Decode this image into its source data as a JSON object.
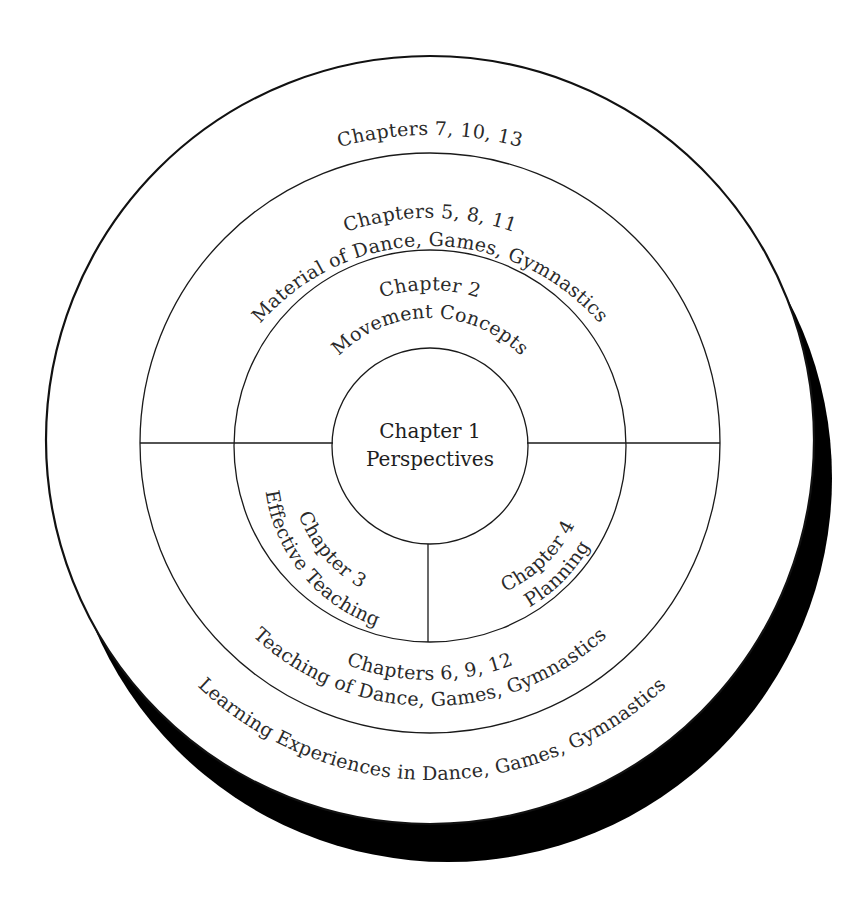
{
  "diagram": {
    "title": "",
    "colors": {
      "line": "#1a1a1a",
      "shadow": "#000000",
      "background": "#ffffff",
      "text": "#2a2a2a"
    },
    "center": {
      "line1": "Chapter 1",
      "line2": "Perspectives"
    },
    "ring2": {
      "top": {
        "line1": "Chapter 2",
        "line2": "Movement Concepts"
      },
      "bottom_left": {
        "line1": "Chapter 3",
        "line2": "Effective Teaching"
      },
      "bottom_right": {
        "line1": "Chapter 4",
        "line2": "Planning"
      }
    },
    "ring3": {
      "top": {
        "line1": "Chapters 5, 8, 11",
        "line2": "Material of Dance, Games, Gymnastics"
      },
      "bottom": {
        "line1": "Chapters 6, 9, 12",
        "line2": "Teaching of Dance, Games, Gymnastics"
      }
    },
    "ring4": {
      "top": {
        "line1": "Chapters 7, 10, 13"
      },
      "bottom": {
        "line1": "Learning Experiences in Dance, Games, Gymnastics"
      }
    }
  }
}
